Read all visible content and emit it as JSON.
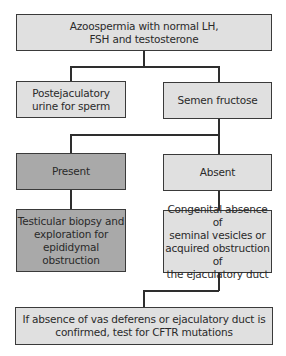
{
  "diagram": {
    "type": "flowchart",
    "colors": {
      "light_box": "#e0e0e0",
      "dark_box": "#a9a9a9",
      "border": "#3a3a3a",
      "line": "#2e2e2e"
    },
    "nodes": {
      "root": {
        "text": "Azoospermia with normal LH,\nFSH and testosterone"
      },
      "postejaculatory": {
        "text": "Postejaculatory\nurine for sperm"
      },
      "fructose": {
        "text": "Semen fructose"
      },
      "present": {
        "text": "Present"
      },
      "absent": {
        "text": "Absent"
      },
      "biopsy": {
        "text": "Testicular biopsy and\nexploration for\nepididymal obstruction"
      },
      "congenital": {
        "text": "Congenital absence of\nseminal vesicles or\nacquired obstruction of\nthe ejaculatory duct"
      },
      "cftr": {
        "text": "If absence of vas deferens or ejaculatory duct is\nconfirmed, test for CFTR mutations"
      }
    },
    "edges": [
      [
        "root",
        "postejaculatory"
      ],
      [
        "root",
        "fructose"
      ],
      [
        "fructose",
        "present"
      ],
      [
        "fructose",
        "absent"
      ],
      [
        "present",
        "biopsy"
      ],
      [
        "absent",
        "congenital"
      ],
      [
        "congenital",
        "cftr"
      ]
    ]
  }
}
